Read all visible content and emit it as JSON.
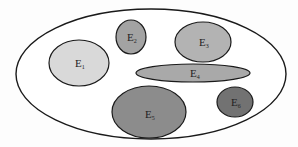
{
  "diagram": {
    "type": "set-diagram",
    "universe": {
      "cx": 151,
      "cy": 74,
      "rx": 135,
      "ry": 65,
      "fill": "#ffffff",
      "stroke": "#1a1a1a"
    },
    "sets": [
      {
        "id": "E1",
        "letter": "E",
        "subscript": "1",
        "cx": 79,
        "cy": 63,
        "rx": 30,
        "ry": 23,
        "fill": "#d9d9d9",
        "tx": 75,
        "ty": 67
      },
      {
        "id": "E2",
        "letter": "E",
        "subscript": "2",
        "cx": 131,
        "cy": 37,
        "rx": 15,
        "ry": 17,
        "fill": "#a3a3a3",
        "tx": 127,
        "ty": 41
      },
      {
        "id": "E3",
        "letter": "E",
        "subscript": "3",
        "cx": 203,
        "cy": 42,
        "rx": 28,
        "ry": 20,
        "fill": "#b3b3b3",
        "tx": 199,
        "ty": 46
      },
      {
        "id": "E4",
        "letter": "E",
        "subscript": "4",
        "cx": 193,
        "cy": 73,
        "rx": 57,
        "ry": 9,
        "fill": "#a9a9a9",
        "tx": 190,
        "ty": 77
      },
      {
        "id": "E5",
        "letter": "E",
        "subscript": "5",
        "cx": 149,
        "cy": 112,
        "rx": 37,
        "ry": 26,
        "fill": "#8c8c8c",
        "tx": 145,
        "ty": 118
      },
      {
        "id": "E6",
        "letter": "E",
        "subscript": "6",
        "cx": 235,
        "cy": 102,
        "rx": 18,
        "ry": 15,
        "fill": "#727272",
        "tx": 231,
        "ty": 106
      }
    ],
    "stroke": "#1a1a1a"
  }
}
